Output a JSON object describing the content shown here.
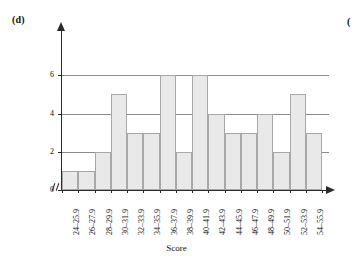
{
  "panel": {
    "label": "(d)",
    "neighbor_label": "("
  },
  "chart_data": {
    "type": "bar",
    "title": "",
    "xlabel": "Score",
    "ylabel": "Frequency",
    "categories": [
      "24–25.9",
      "26–27.9",
      "28–29.9",
      "30–31.9",
      "32–33.9",
      "34–35.9",
      "36–37.9",
      "38–39.9",
      "40–41.9",
      "42–43.9",
      "44–45.9",
      "46–47.9",
      "48–49.9",
      "50–51.9",
      "52–53.9",
      "54–55.9"
    ],
    "values": [
      1,
      1,
      2,
      5,
      3,
      3,
      6,
      2,
      6,
      4,
      3,
      3,
      4,
      2,
      5,
      3
    ],
    "ylim": [
      0,
      6.8
    ],
    "yticks": [
      0,
      2,
      4,
      6
    ],
    "ytick_labels": [
      "0",
      "2",
      "4",
      "6"
    ],
    "gridlines": [
      2,
      4,
      6
    ],
    "grid": true,
    "legend": "none",
    "axis_break": "//",
    "bar_fill_color": "#e9e9e9",
    "bar_edge_color": "#a8a8a8",
    "axis_color": "#2a2a2a",
    "gridline_color": "#8c8c8c"
  }
}
